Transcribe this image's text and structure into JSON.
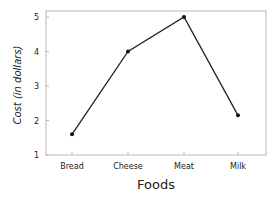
{
  "chart_data": {
    "type": "line",
    "title": "",
    "xlabel": "Foods",
    "ylabel": "Cost (in dollars)",
    "categories": [
      "Bread",
      "Cheese",
      "Meat",
      "Milk"
    ],
    "values": [
      1.6,
      4.0,
      5.0,
      2.15
    ],
    "ylim": [
      1,
      5
    ],
    "yticks": [
      1,
      2,
      3,
      4,
      5
    ],
    "grid": false,
    "legend": null,
    "markers": true
  },
  "style": {
    "line_color": "#222222",
    "frame_color": "#b8b8b8",
    "marker_color": "#111111"
  }
}
